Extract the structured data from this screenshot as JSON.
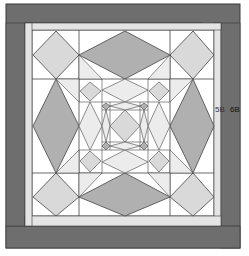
{
  "diagram": {
    "labels": {
      "label_5b": "5B",
      "label_6b": "6B"
    },
    "colors": {
      "outer_border": "#6e6e6e",
      "outer_border_edge": "#3a3a3a",
      "inner_border": "#e4e4e4",
      "background": "#ffffff",
      "diamond_dark": "#b0b0b0",
      "diamond_light": "#d9d9d9",
      "triangle_light": "#ececec",
      "line": "#444444"
    }
  }
}
